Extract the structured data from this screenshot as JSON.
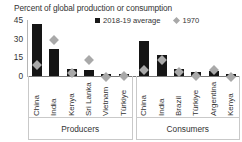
{
  "chart_data": {
    "type": "bar",
    "title": "Percent of global production or consumption",
    "xlabel": "",
    "ylabel": "",
    "ylim": [
      0,
      45
    ],
    "yticks": [
      "0",
      "15",
      "30",
      "45"
    ],
    "ytick_values": [
      0,
      15,
      30,
      45
    ],
    "grid": false,
    "legend_position": "top-right",
    "legend": [
      {
        "name": "2018-19 average",
        "marker": "square",
        "color": "#151515"
      },
      {
        "name": "1970",
        "marker": "diamond",
        "color": "#a9a9a9"
      }
    ],
    "groups": [
      {
        "name": "Producers",
        "categories": [
          "China",
          "India",
          "Kenya",
          "Sri Lanka",
          "Vietnam",
          "Türkiye"
        ],
        "series": [
          {
            "name": "2018-19 average",
            "values": [
              42,
              21.5,
              6,
              4.5,
              2,
              2
            ]
          },
          {
            "name": "1970",
            "values": [
              12,
              32,
              5.5,
              16,
              2,
              3
            ]
          }
        ]
      },
      {
        "name": "Consumers",
        "categories": [
          "China",
          "India",
          "Brazil",
          "Türkiye",
          "Argentina",
          "Kenya"
        ],
        "series": [
          {
            "name": "2018-19 average",
            "values": [
              28,
              16.5,
              6,
              3,
              4,
              1.5
            ]
          },
          {
            "name": "1970",
            "values": [
              7.5,
              16,
              6,
              3,
              8,
              2
            ]
          }
        ]
      }
    ]
  },
  "colors": {
    "bar": "#151515",
    "marker": "#a9a9a9",
    "axis": "#7a7a7a",
    "box": "#c9c9c9",
    "text": "#333333"
  }
}
